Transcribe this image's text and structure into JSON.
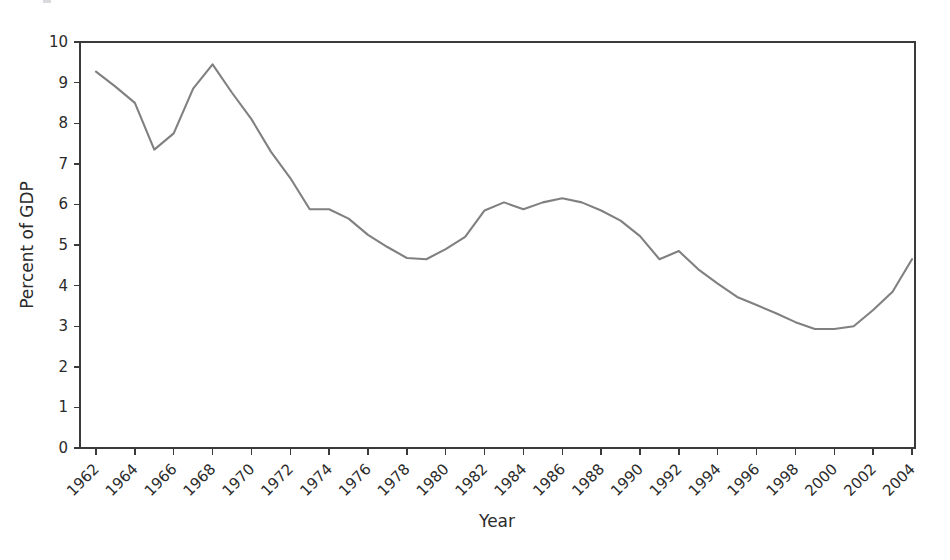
{
  "chart_data": {
    "type": "line",
    "title": "",
    "xlabel": "Year",
    "ylabel": "Percent of GDP",
    "xlim": [
      1962,
      2004
    ],
    "ylim": [
      0,
      10
    ],
    "grid": false,
    "legend": false,
    "line_color": "#808080",
    "axis_color": "#3a3a3a",
    "x_tick_labels": [
      "1962",
      "1964",
      "1966",
      "1968",
      "1970",
      "1972",
      "1974",
      "1976",
      "1978",
      "1980",
      "1982",
      "1984",
      "1986",
      "1988",
      "1990",
      "1992",
      "1994",
      "1996",
      "1998",
      "2000",
      "2002",
      "2004"
    ],
    "x_tick_values": [
      1962,
      1964,
      1966,
      1968,
      1970,
      1972,
      1974,
      1976,
      1978,
      1980,
      1982,
      1984,
      1986,
      1988,
      1990,
      1992,
      1994,
      1996,
      1998,
      2000,
      2002,
      2004
    ],
    "y_tick_labels": [
      "0",
      "1",
      "2",
      "3",
      "4",
      "5",
      "6",
      "7",
      "8",
      "9",
      "10"
    ],
    "y_tick_values": [
      0,
      1,
      2,
      3,
      4,
      5,
      6,
      7,
      8,
      9,
      10
    ],
    "x": [
      1962,
      1963,
      1964,
      1965,
      1966,
      1967,
      1968,
      1969,
      1970,
      1971,
      1972,
      1973,
      1974,
      1975,
      1976,
      1977,
      1978,
      1979,
      1980,
      1981,
      1982,
      1983,
      1984,
      1985,
      1986,
      1987,
      1988,
      1989,
      1990,
      1991,
      1992,
      1993,
      1994,
      1995,
      1996,
      1997,
      1998,
      1999,
      2000,
      2001,
      2002,
      2003,
      2004
    ],
    "values": [
      9.27,
      8.9,
      8.5,
      7.35,
      7.75,
      8.85,
      9.45,
      8.75,
      8.1,
      7.3,
      6.65,
      5.88,
      5.88,
      5.65,
      5.25,
      4.95,
      4.68,
      4.65,
      4.9,
      5.2,
      5.85,
      6.05,
      5.88,
      6.05,
      6.15,
      6.05,
      5.85,
      5.6,
      5.22,
      4.65,
      4.85,
      4.4,
      4.05,
      3.72,
      3.52,
      3.32,
      3.1,
      2.93,
      2.93,
      3.0,
      3.4,
      3.85,
      4.65
    ]
  },
  "axes": {
    "x_title": "Year",
    "y_title": "Percent of GDP"
  }
}
